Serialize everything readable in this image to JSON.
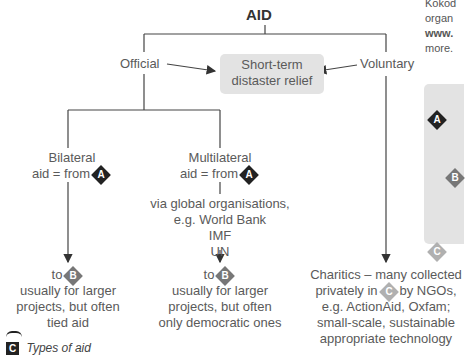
{
  "diagram": {
    "title": "AID",
    "official": "Official",
    "voluntary": "Voluntary",
    "short_term": {
      "line1": "Short-term",
      "line2": "distaster relief"
    },
    "bilateral": {
      "line1": "Bilateral",
      "line2": "aid = from",
      "badge": "A"
    },
    "multilateral": {
      "line1": "Multilateral",
      "line2": "aid = from",
      "badge": "A"
    },
    "via": {
      "line1": "via global organisations,",
      "line2": "e.g. World Bank",
      "line3": "IMF",
      "line4": "UN"
    },
    "bilateral_to": {
      "prefix": "to",
      "badge": "B",
      "line1": "usually for larger",
      "line2": "projects, but often",
      "line3": "tied aid"
    },
    "multilateral_to": {
      "prefix": "to",
      "badge": "B",
      "line1": "usually for larger",
      "line2": "projects, but often",
      "line3": "only democratic ones"
    },
    "charities": {
      "line1": "Charitics – many collected",
      "line2_pre": "privately in",
      "badge": "C",
      "line2_post": "by NGOs,",
      "line3": "e.g. ActionAid, Oxfam;",
      "line4": "small-scale, sustainable",
      "line5": "appropriate technology"
    }
  },
  "caption": {
    "icon": "C",
    "text": "Types of aid"
  },
  "side_text": {
    "line1": "Kokod",
    "line2": "organ",
    "line3": "www.",
    "line4": "more."
  },
  "legend": {
    "badges": [
      "A",
      "B",
      "C"
    ]
  },
  "colors": {
    "badge_a": "#222222",
    "badge_b": "#777777",
    "badge_c": "#b0b0b0",
    "box": "#e3e3e3"
  }
}
